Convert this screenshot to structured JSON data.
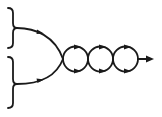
{
  "diagram": {
    "type": "feynman-like loop diagram",
    "colors": {
      "ink": "#1a1a1a",
      "background": "#ffffff"
    },
    "inputs": [
      {
        "id": "input-upper",
        "bracket": "right-brace",
        "arrow_direction": "right"
      },
      {
        "id": "input-lower",
        "bracket": "right-brace",
        "arrow_direction": "right"
      }
    ],
    "junction": "vertex where both inputs merge",
    "loops": [
      {
        "id": "loop-1",
        "arrows": [
          "top-right",
          "bottom-right"
        ]
      },
      {
        "id": "loop-2",
        "arrows": [
          "top-right",
          "bottom-right"
        ]
      },
      {
        "id": "loop-3",
        "arrows": [
          "top-right",
          "bottom-right"
        ]
      }
    ],
    "output": {
      "arrow_direction": "right"
    },
    "labels": []
  }
}
